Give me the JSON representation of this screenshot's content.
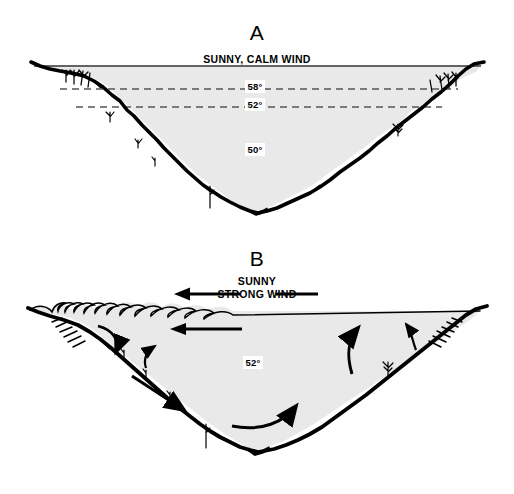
{
  "figure": {
    "type": "lake-thermal-stratification-diagram",
    "background_color": "#ffffff",
    "water_fill_color": "#e9e9e9",
    "shore_color": "#000000",
    "line_color": "#000000"
  },
  "panels": [
    {
      "id": "A",
      "letter": "A",
      "condition_lines": [
        "SUNNY, CALM WIND"
      ],
      "surface_style": "flat",
      "thermocline_lines": 2,
      "temperature_labels": [
        {
          "value": "58°",
          "zone": "epilimnion"
        },
        {
          "value": "52°",
          "zone": "metalimnion"
        },
        {
          "value": "50°",
          "zone": "hypolimnion"
        }
      ],
      "arrows": []
    },
    {
      "id": "B",
      "letter": "B",
      "condition_lines": [
        "SUNNY",
        "STRONG WIND"
      ],
      "surface_style": "breaking-waves",
      "thermocline_lines": 0,
      "temperature_labels": [
        {
          "value": "52°",
          "zone": "mixed"
        }
      ],
      "arrows": [
        {
          "name": "wind-arrow",
          "direction": "left"
        },
        {
          "name": "surface-drift-arrow",
          "direction": "left"
        },
        {
          "name": "downwelling-arrow-left",
          "direction": "down"
        },
        {
          "name": "return-flow-arrow-left",
          "direction": "down-right"
        },
        {
          "name": "bottom-return-arrow",
          "direction": "up-right"
        },
        {
          "name": "upwelling-arrow-right",
          "direction": "up"
        },
        {
          "name": "upwelling-arrow-far-right",
          "direction": "up"
        },
        {
          "name": "eddy-arrow-mid-left",
          "direction": "up"
        }
      ]
    }
  ]
}
